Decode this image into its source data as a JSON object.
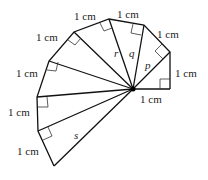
{
  "diagram": {
    "type": "spiral-of-right-triangles",
    "unit_label": "1 cm",
    "center": [
      133,
      89
    ],
    "vertices": [
      [
        170,
        89
      ],
      [
        170,
        52
      ],
      [
        144,
        25
      ],
      [
        109,
        19
      ],
      [
        74,
        32
      ],
      [
        49,
        61
      ],
      [
        37,
        97
      ],
      [
        38,
        131
      ],
      [
        54,
        166
      ]
    ],
    "labels": {
      "outer_edges": [
        "1 cm",
        "1 cm",
        "1 cm",
        "1 cm",
        "1 cm",
        "1 cm",
        "1 cm",
        "1 cm",
        "1 cm"
      ],
      "p": "p",
      "q": "q",
      "r": "r",
      "s": "s"
    }
  }
}
